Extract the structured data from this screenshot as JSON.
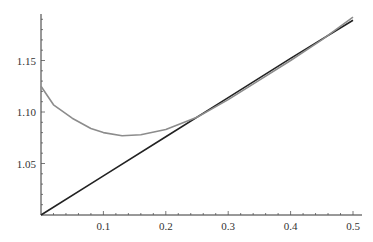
{
  "chart_data": {
    "type": "line",
    "title": "",
    "xlabel": "",
    "ylabel": "",
    "xlim": [
      0,
      0.5
    ],
    "ylim": [
      1.0,
      1.195
    ],
    "grid": false,
    "legend": null,
    "x_ticks": [
      "0.1",
      "0.2",
      "0.3",
      "0.4",
      "0.5"
    ],
    "y_ticks": [
      "1.05",
      "1.10",
      "1.15"
    ],
    "series": [
      {
        "name": "black line",
        "color": "#222222",
        "x": [
          0,
          0.1,
          0.2,
          0.3,
          0.4,
          0.5
        ],
        "y": [
          1.0,
          1.038,
          1.076,
          1.114,
          1.152,
          1.189
        ]
      },
      {
        "name": "gray curve",
        "color": "#8c8c8c",
        "x": [
          0,
          0.02,
          0.05,
          0.08,
          0.1,
          0.13,
          0.16,
          0.2,
          0.25,
          0.3,
          0.35,
          0.4,
          0.45,
          0.5
        ],
        "y": [
          1.125,
          1.107,
          1.094,
          1.084,
          1.08,
          1.077,
          1.078,
          1.083,
          1.095,
          1.112,
          1.131,
          1.15,
          1.17,
          1.192
        ]
      }
    ]
  }
}
